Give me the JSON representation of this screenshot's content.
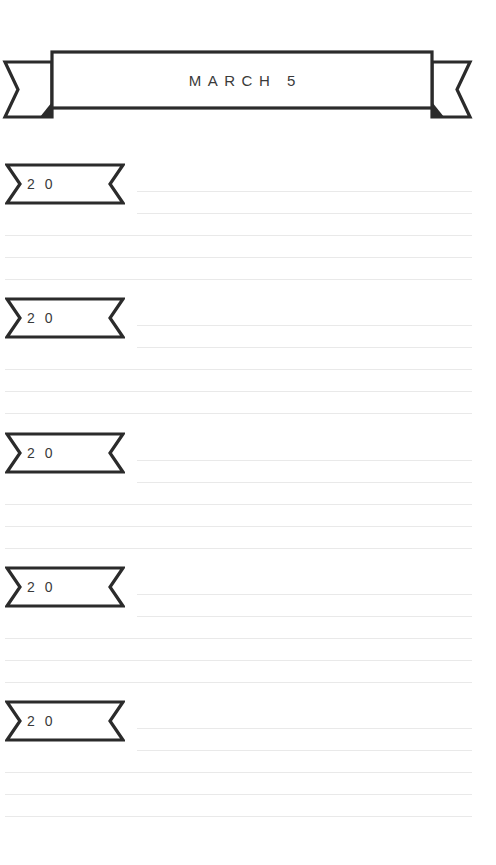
{
  "page": {
    "width": 496,
    "height": 865,
    "background_color": "#ffffff",
    "kind": "printable-journal-page"
  },
  "colors": {
    "ink": "#2b2b2b",
    "text": "#3a3a3a",
    "rule": "#e9e9e9",
    "paper": "#ffffff"
  },
  "header": {
    "icon": "ribbon-banner-icon",
    "title": "MARCH 5"
  },
  "entries": [
    {
      "tag_icon": "ribbon-tag-icon",
      "year_label": "2 0",
      "top": 163,
      "rules": [
        {
          "style": "short",
          "top": 28
        },
        {
          "style": "short",
          "top": 50
        },
        {
          "style": "full",
          "top": 72
        },
        {
          "style": "full",
          "top": 94
        },
        {
          "style": "full",
          "top": 116
        }
      ]
    },
    {
      "tag_icon": "ribbon-tag-icon",
      "year_label": "2 0",
      "top": 297,
      "rules": [
        {
          "style": "short",
          "top": 28
        },
        {
          "style": "short",
          "top": 50
        },
        {
          "style": "full",
          "top": 72
        },
        {
          "style": "full",
          "top": 94
        },
        {
          "style": "full",
          "top": 116
        }
      ]
    },
    {
      "tag_icon": "ribbon-tag-icon",
      "year_label": "2 0",
      "top": 432,
      "rules": [
        {
          "style": "short",
          "top": 28
        },
        {
          "style": "short",
          "top": 50
        },
        {
          "style": "full",
          "top": 72
        },
        {
          "style": "full",
          "top": 94
        },
        {
          "style": "full",
          "top": 116
        }
      ]
    },
    {
      "tag_icon": "ribbon-tag-icon",
      "year_label": "2 0",
      "top": 566,
      "rules": [
        {
          "style": "short",
          "top": 28
        },
        {
          "style": "short",
          "top": 50
        },
        {
          "style": "full",
          "top": 72
        },
        {
          "style": "full",
          "top": 94
        },
        {
          "style": "full",
          "top": 116
        }
      ]
    },
    {
      "tag_icon": "ribbon-tag-icon",
      "year_label": "2 0",
      "top": 700,
      "rules": [
        {
          "style": "short",
          "top": 28
        },
        {
          "style": "short",
          "top": 50
        },
        {
          "style": "full",
          "top": 72
        },
        {
          "style": "full",
          "top": 94
        },
        {
          "style": "full",
          "top": 116
        }
      ]
    }
  ]
}
